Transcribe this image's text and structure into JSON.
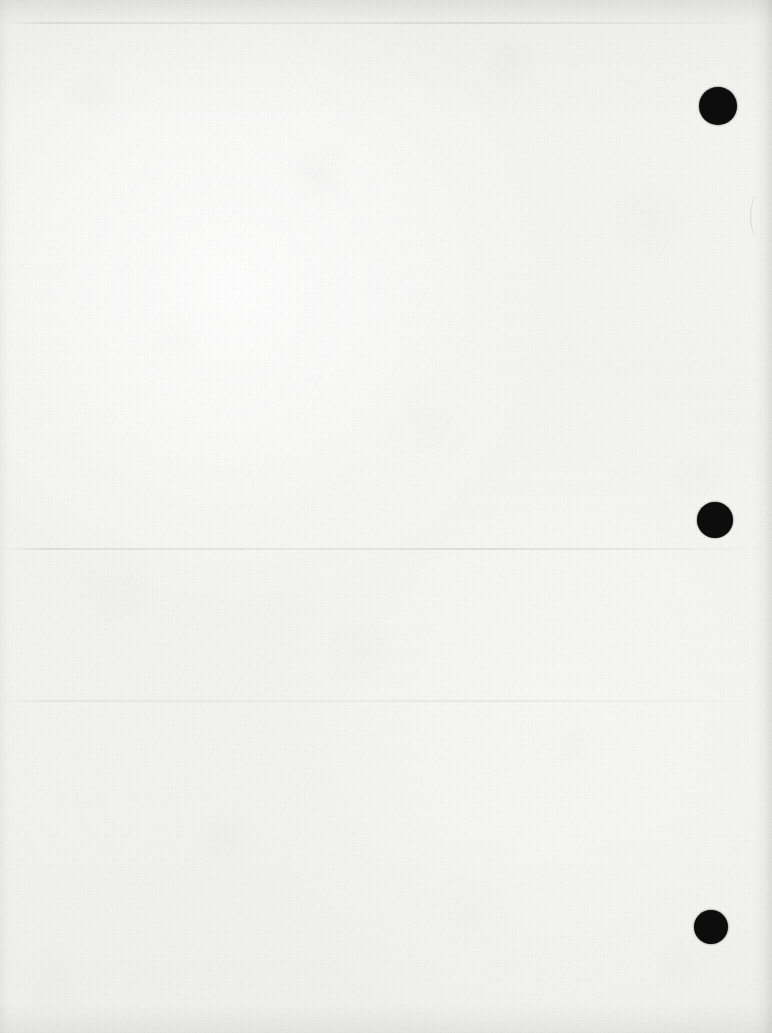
{
  "document": {
    "kind": "scanned-page",
    "page_state": "blank",
    "visible_text": "",
    "width_px": 772,
    "height_px": 1033,
    "paper_color": "#f2f2f1",
    "ink_color": "#0d0d0d"
  },
  "marks": {
    "label": "registration-marks",
    "shape": "filled-circle",
    "color": "#0d0d0d",
    "count": 3,
    "items": [
      {
        "name": "registration-mark-top",
        "cx": 718,
        "cy": 106,
        "r": 19
      },
      {
        "name": "registration-mark-middle",
        "cx": 715,
        "cy": 520,
        "r": 18
      },
      {
        "name": "registration-mark-bottom",
        "cx": 711,
        "cy": 927,
        "r": 17
      }
    ]
  },
  "creases": {
    "label": "fold-creases",
    "color": "#969694",
    "items": [
      {
        "name": "crease-top",
        "y": 22
      },
      {
        "name": "crease-middle",
        "y": 548
      },
      {
        "name": "crease-lower",
        "y": 700
      }
    ]
  },
  "edges": {
    "label": "page-edge-shading",
    "shadow_color": "#696967",
    "sides": [
      "top",
      "right",
      "bottom",
      "left"
    ]
  },
  "texture": {
    "label": "paper-fiber-texture",
    "fiber_color": "#a0a09e",
    "mottle_color": "#adadaa"
  }
}
